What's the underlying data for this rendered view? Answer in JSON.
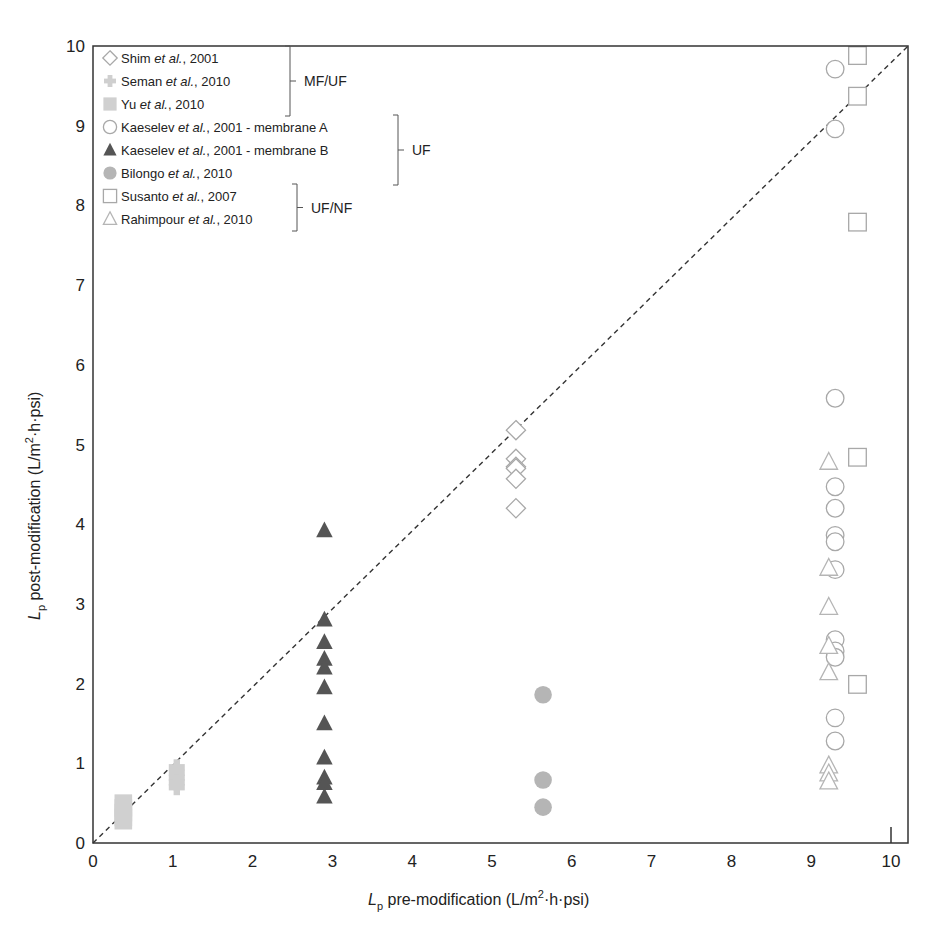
{
  "chart_data": {
    "type": "scatter",
    "title": "",
    "xlabel": "L_p pre-modification (L/m²·h·psi)",
    "ylabel": "L_p post-modification (L/m²·h·psi)",
    "xlim": [
      0,
      10.2
    ],
    "ylim": [
      0,
      10
    ],
    "x_ticks": [
      0,
      1,
      2,
      3,
      4,
      5,
      6,
      7,
      8,
      9,
      10
    ],
    "y_ticks": [
      0,
      1,
      2,
      3,
      4,
      5,
      6,
      7,
      8,
      9,
      10
    ],
    "grid": false,
    "reference_line": {
      "type": "y=x",
      "style": "dashed",
      "color": "#333333"
    },
    "legend_position": "upper left",
    "series": [
      {
        "name": "Shim et al., 2001",
        "marker": "diamond-open",
        "color": "#a8a8a8",
        "group": "MF/UF",
        "points": [
          [
            5.3,
            5.18
          ],
          [
            5.3,
            4.82
          ],
          [
            5.3,
            4.72
          ],
          [
            5.3,
            4.7
          ],
          [
            5.3,
            4.57
          ],
          [
            5.3,
            4.2
          ]
        ]
      },
      {
        "name": "Seman et al., 2010",
        "marker": "plus-filled",
        "color": "#cfcfcf",
        "group": "MF/UF",
        "points": [
          [
            1.05,
            0.95
          ],
          [
            1.05,
            0.88
          ],
          [
            1.05,
            0.82
          ],
          [
            1.05,
            0.76
          ],
          [
            1.05,
            0.7
          ]
        ]
      },
      {
        "name": "Yu et al., 2010",
        "marker": "square-filled",
        "color": "#d0d0d0",
        "group": "MF/UF",
        "points": [
          [
            0.38,
            0.5
          ],
          [
            0.38,
            0.44
          ],
          [
            0.38,
            0.38
          ],
          [
            0.38,
            0.32
          ],
          [
            0.38,
            0.28
          ]
        ]
      },
      {
        "name": "Kaeselev et al., 2001 - membrane A",
        "marker": "circle-open",
        "color": "#a8a8a8",
        "group": "UF",
        "points": [
          [
            9.3,
            9.71
          ],
          [
            9.3,
            8.96
          ],
          [
            9.3,
            5.58
          ],
          [
            9.3,
            4.47
          ],
          [
            9.3,
            4.2
          ],
          [
            9.3,
            3.86
          ],
          [
            9.3,
            3.78
          ],
          [
            9.3,
            3.43
          ],
          [
            9.3,
            2.55
          ],
          [
            9.3,
            2.41
          ],
          [
            9.3,
            2.33
          ],
          [
            9.3,
            1.57
          ],
          [
            9.3,
            1.28
          ]
        ]
      },
      {
        "name": "Kaeselev et al., 2001 - membrane B",
        "marker": "triangle-filled",
        "color": "#555555",
        "group": "UF",
        "points": [
          [
            2.9,
            3.92
          ],
          [
            2.9,
            2.8
          ],
          [
            2.9,
            2.52
          ],
          [
            2.9,
            2.31
          ],
          [
            2.9,
            2.2
          ],
          [
            2.9,
            1.95
          ],
          [
            2.9,
            1.5
          ],
          [
            2.9,
            1.07
          ],
          [
            2.9,
            0.82
          ],
          [
            2.9,
            0.75
          ],
          [
            2.9,
            0.58
          ]
        ]
      },
      {
        "name": "Bilongo et al., 2010",
        "marker": "circle-filled",
        "color": "#b5b5b5",
        "group": "UF",
        "points": [
          [
            5.64,
            1.86
          ],
          [
            5.64,
            0.79
          ],
          [
            5.64,
            0.45
          ]
        ]
      },
      {
        "name": "Susanto et al., 2007",
        "marker": "square-open",
        "color": "#a8a8a8",
        "group": "UF/NF",
        "points": [
          [
            9.58,
            9.88
          ],
          [
            9.58,
            9.37
          ],
          [
            9.58,
            7.79
          ],
          [
            9.58,
            4.84
          ],
          [
            9.58,
            1.99
          ]
        ]
      },
      {
        "name": "Rahimpour et al., 2010",
        "marker": "triangle-open",
        "color": "#b5b5b5",
        "group": "UF/NF",
        "points": [
          [
            9.22,
            4.78
          ],
          [
            9.22,
            3.45
          ],
          [
            9.22,
            2.96
          ],
          [
            9.22,
            2.47
          ],
          [
            9.22,
            2.14
          ],
          [
            9.22,
            0.97
          ],
          [
            9.22,
            0.87
          ],
          [
            9.22,
            0.77
          ]
        ]
      }
    ],
    "legend_groups": [
      {
        "label": "MF/UF",
        "from": 0,
        "to": 2
      },
      {
        "label": "UF",
        "from": 3,
        "to": 5
      },
      {
        "label": "UF/NF",
        "from": 6,
        "to": 7
      }
    ]
  },
  "layout": {
    "plot": {
      "left": 93,
      "top": 46,
      "right": 908,
      "bottom": 843
    },
    "x_unit_px": 79.8,
    "y_unit_px": 79.7
  }
}
